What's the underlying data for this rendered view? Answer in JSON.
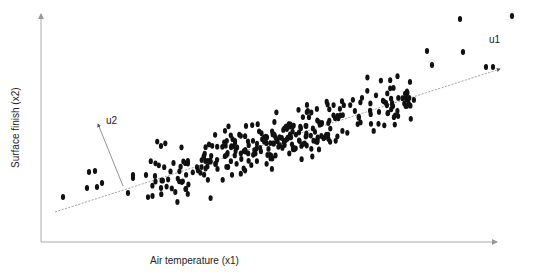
{
  "chart_data": {
    "type": "scatter",
    "title": "",
    "xlabel": "Air temperature (x1)",
    "ylabel": "Surface finish (x2)",
    "grid": false,
    "legend": "none",
    "ticks": "none",
    "vectors": [
      {
        "name": "u1",
        "description": "principal direction along the data trend",
        "from": [
          55,
          212
        ],
        "to": [
          500,
          69
        ]
      },
      {
        "name": "u2",
        "description": "orthogonal direction",
        "from": [
          123,
          186
        ],
        "to": [
          98,
          124
        ]
      }
    ],
    "outliers": [
      [
        63,
        197
      ],
      [
        89,
        172
      ],
      [
        95,
        171
      ],
      [
        87,
        188
      ],
      [
        97,
        187
      ],
      [
        102,
        183
      ],
      [
        128,
        193
      ],
      [
        133,
        178
      ],
      [
        133,
        175
      ],
      [
        146,
        175
      ],
      [
        155,
        176
      ],
      [
        161,
        188
      ],
      [
        161,
        146
      ],
      [
        427,
        51
      ],
      [
        463,
        52
      ],
      [
        460,
        19
      ],
      [
        512,
        16
      ],
      [
        432,
        65
      ],
      [
        493,
        67
      ],
      [
        486,
        67
      ]
    ],
    "point_count_estimate": 330,
    "color": "#111111"
  },
  "labels": {
    "x_axis": "Air temperature (x1)",
    "y_axis": "Surface finish (x2)",
    "u1": "u1",
    "u2": "u2"
  }
}
